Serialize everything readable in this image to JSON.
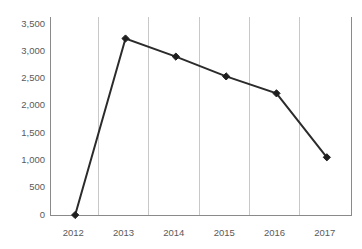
{
  "chart_data": {
    "type": "line",
    "title": "",
    "subtitle": "",
    "xlabel": "",
    "ylabel": "",
    "categories": [
      "2012",
      "2013",
      "2014",
      "2015",
      "2016",
      "2017"
    ],
    "values": [
      0,
      3120,
      2800,
      2450,
      2150,
      1020
    ],
    "series": [
      {
        "name": "",
        "values": [
          0,
          3120,
          2800,
          2450,
          2150,
          1020
        ]
      }
    ],
    "ylim": [
      0,
      3500
    ],
    "ytick_values": [
      0,
      500,
      1000,
      1500,
      2000,
      2500,
      3000,
      3500
    ],
    "ytick_labels": [
      "0",
      "500",
      "1,000",
      "1,500",
      "2,000",
      "2,500",
      "3,000",
      "3,500"
    ],
    "xtick_labels": [
      "2012",
      "2013",
      "2014",
      "2015",
      "2016",
      "2017"
    ],
    "grid": {
      "vertical": true,
      "horizontal": false,
      "color": "#c8c8c8"
    },
    "legend": {
      "visible": false,
      "position": "none",
      "entries": []
    },
    "annotations": [],
    "marker": "diamond",
    "colors": {
      "line": "#2b2b2b",
      "marker": "#1f1f1f",
      "axis": "#8a8a8a",
      "grid": "#c8c8c8",
      "tick_text": "#5a5a5a",
      "background": "#ffffff"
    }
  }
}
